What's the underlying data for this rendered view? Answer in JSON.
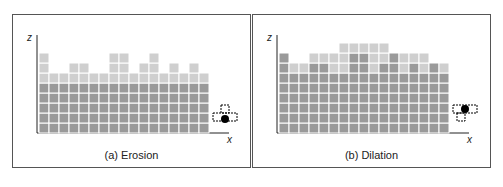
{
  "panels": [
    {
      "id": "erosion",
      "caption": "(a) Erosion",
      "axis_z": "z",
      "axis_x": "x",
      "original_heights": [
        8,
        6,
        6,
        7,
        7,
        6,
        6,
        8,
        8,
        6,
        7,
        8,
        6,
        7,
        6,
        7,
        6
      ],
      "result_heights": [
        5,
        5,
        5,
        5,
        5,
        5,
        5,
        5,
        5,
        5,
        5,
        5,
        5,
        5,
        5,
        5,
        5
      ],
      "structuring_element": "erosion-kernel"
    },
    {
      "id": "dilation",
      "caption": "(b) Dilation",
      "axis_z": "z",
      "axis_x": "x",
      "original_heights": [
        8,
        6,
        6,
        7,
        7,
        6,
        6,
        8,
        8,
        6,
        7,
        8,
        6,
        7,
        6,
        7,
        6
      ],
      "result_heights": [
        8,
        7,
        7,
        8,
        8,
        8,
        9,
        9,
        9,
        9,
        9,
        8,
        8,
        8,
        8,
        7,
        7
      ],
      "structuring_element": "dilation-kernel"
    }
  ],
  "colors": {
    "cell_dark": "#9a9a9a",
    "cell_light": "#cfcfcf",
    "grid_line": "#ffffff",
    "axis": "#222222",
    "kernel_dot": "#000000"
  }
}
